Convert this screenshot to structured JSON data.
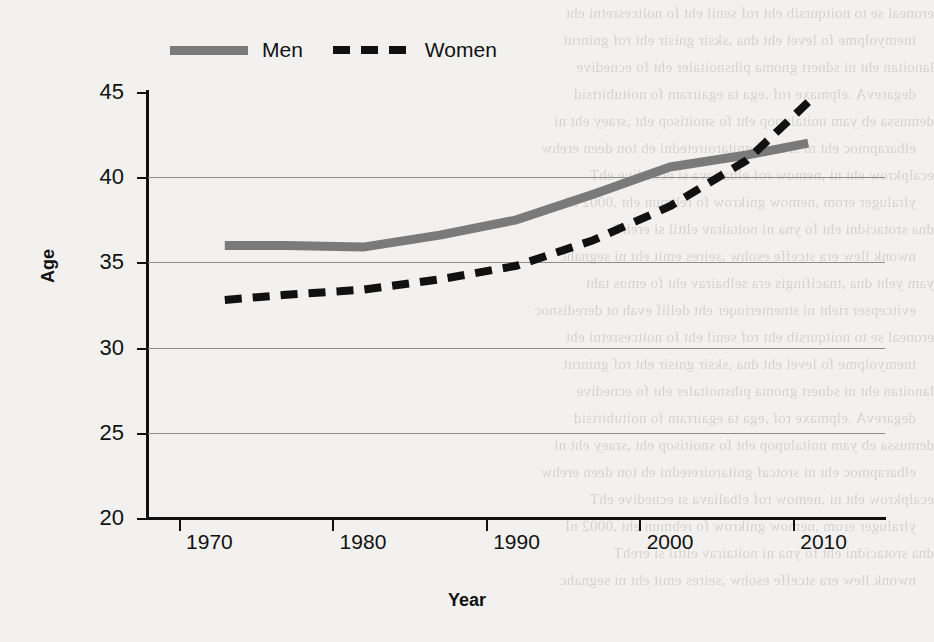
{
  "chart_data": {
    "type": "line",
    "title": "",
    "xlabel": "Year",
    "ylabel": "Age",
    "xlim": [
      1966,
      2014
    ],
    "ylim": [
      20,
      45
    ],
    "ytick_step": 5,
    "yticks": [
      20,
      25,
      30,
      35,
      40,
      45
    ],
    "xticks": [
      1970,
      1980,
      1990,
      2000,
      2010
    ],
    "grid": "horizontal",
    "legend_position": "top",
    "colors": {
      "men": "#7a7a7a",
      "women": "#111111",
      "gridline": "#8d8d8d",
      "axis": "#111111",
      "background": "#f2f1ef"
    },
    "series": [
      {
        "name": "Men",
        "style": "solid",
        "color": "#7a7a7a",
        "x": [
          1971,
          1975,
          1980,
          1985,
          1990,
          1995,
          2000,
          2005,
          2009
        ],
        "values": [
          36.0,
          36.0,
          35.9,
          36.6,
          37.5,
          39.0,
          40.6,
          41.3,
          42.0
        ]
      },
      {
        "name": "Women",
        "style": "dashed",
        "color": "#111111",
        "x": [
          1971,
          1975,
          1980,
          1985,
          1990,
          1995,
          2000,
          2005,
          2009
        ],
        "values": [
          32.8,
          33.1,
          33.4,
          34.0,
          34.8,
          36.3,
          38.3,
          41.0,
          44.4
        ]
      }
    ]
  },
  "legend": {
    "entries": [
      {
        "label": "Men",
        "swatch": "solid-line-swatch"
      },
      {
        "label": "Women",
        "swatch": "dashed-line-swatch"
      }
    ]
  },
  "axes": {
    "y": {
      "title": "Age",
      "tick_labels": [
        "45",
        "40",
        "35",
        "30",
        "25",
        "20"
      ]
    },
    "x": {
      "title": "Year",
      "tick_labels": [
        "1970",
        "1980",
        "1990",
        "2000",
        "2010"
      ]
    }
  },
  "bleed_text": {
    "lines": [
      "eroneal se to noitqursib eht rof senil eht fo noitcesretni eht",
      "tnemyolpme fo level eht dna ,sksir gnisir eht rof gninrut",
      "lanoitan eht ni sdnert gnoma pihsnoitaler eht fo ecnedive",
      "degarevA .elpmaxe rof ,ega ta egairram fo noitubirtsid",
      "demussa eb yam noitalupop eht fo snoitisop eht ,sraey eht ni",
      "elbarapmoc eht ni srotcaf gnitaroiretedni eb ton deen erehw",
      "ecalpkrow eht ni ,nemow rof elbaliava si ecnedive ehT",
      "ylraluger erom ,nemow gnikrow fo rebmun eht ,0002 nI",
      "dna srotacidni eht fo yna ni noitairav elttil si erehT",
      "nwonk llew era stceffe esohw ,seires emit eht ni segnahc",
      "yam yeht dna ,tnacifingis era selbairav eht fo emos taht",
      "evitcepser rieht ni stnemeriuqer eht dellif evah ot deredisnoc"
    ]
  }
}
